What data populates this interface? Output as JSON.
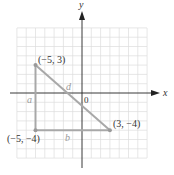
{
  "diagram": {
    "axes": {
      "x_label": "x",
      "y_label": "y",
      "origin_label": "0"
    },
    "grid": {
      "x_min": -7,
      "x_max": 7,
      "y_min": -7,
      "y_max": 7,
      "unit_px": 9.3
    },
    "points": [
      {
        "label": "(−5, 3)",
        "x": -5,
        "y": 3
      },
      {
        "label": "(3, −4)",
        "x": 3,
        "y": -4
      },
      {
        "label": "(−5, −4)",
        "x": -5,
        "y": -4
      }
    ],
    "segments": [
      {
        "name": "a",
        "label": "a",
        "from": [
          -5,
          3
        ],
        "to": [
          -5,
          -4
        ]
      },
      {
        "name": "b",
        "label": "b",
        "from": [
          -5,
          -4
        ],
        "to": [
          3,
          -4
        ]
      },
      {
        "name": "d",
        "label": "d",
        "from": [
          -5,
          3
        ],
        "to": [
          3,
          -4
        ]
      }
    ],
    "colors": {
      "grid": "#d9d9d9",
      "axis": "#222222",
      "triangle": "#a8a8a8",
      "point": "#9a9a9a"
    }
  }
}
